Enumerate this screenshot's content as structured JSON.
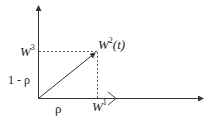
{
  "diagram": {
    "labels": {
      "w3": "W",
      "w3_sup": "3",
      "w2t": "W",
      "w2t_sup": "2",
      "w2t_arg": "(t)",
      "one_minus_rho": "1 - ρ",
      "rho": "ρ",
      "w1": "W",
      "w1_sup": "1"
    },
    "colors": {
      "stroke": "#333333",
      "text": "#222222",
      "background": "#ffffff"
    }
  }
}
